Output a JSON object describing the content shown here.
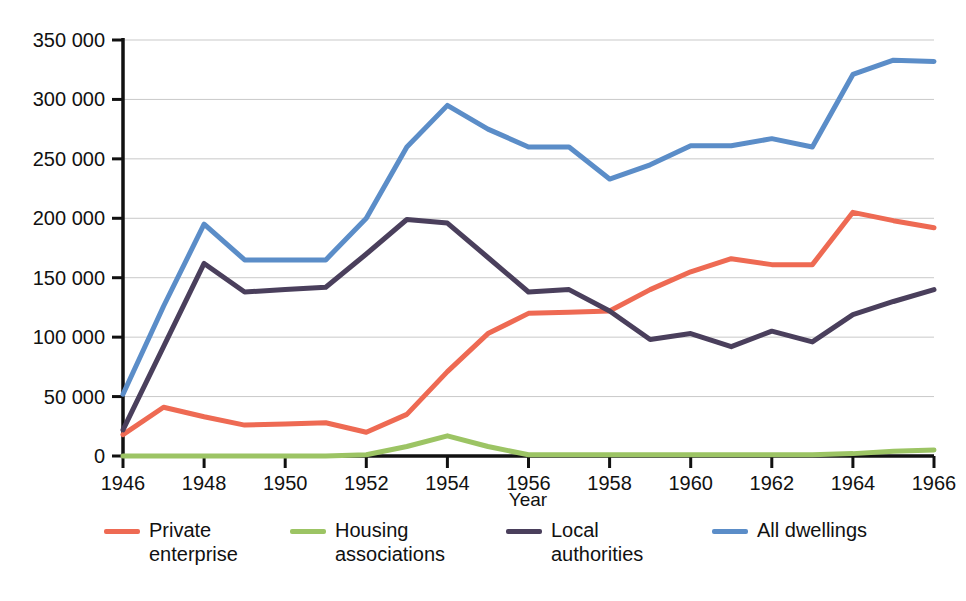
{
  "chart_data": {
    "type": "line",
    "title": "",
    "xlabel": "Year",
    "ylabel": "",
    "xlim": [
      1946,
      1966
    ],
    "ylim": [
      0,
      350000
    ],
    "grid": true,
    "legend_position": "bottom",
    "x": [
      1946,
      1947,
      1948,
      1949,
      1950,
      1951,
      1952,
      1953,
      1954,
      1955,
      1956,
      1957,
      1958,
      1959,
      1960,
      1961,
      1962,
      1963,
      1964,
      1965,
      1966
    ],
    "x_tick_labels": [
      "1946",
      "1948",
      "1950",
      "1952",
      "1954",
      "1956",
      "1958",
      "1960",
      "1962",
      "1964",
      "1966"
    ],
    "x_ticks": [
      1946,
      1948,
      1950,
      1952,
      1954,
      1956,
      1958,
      1960,
      1962,
      1964,
      1966
    ],
    "y_ticks": [
      0,
      50000,
      100000,
      150000,
      200000,
      250000,
      300000,
      350000
    ],
    "y_tick_labels": [
      "0",
      "50 000",
      "100 000",
      "150 000",
      "200 000",
      "250 000",
      "300 000",
      "350 000"
    ],
    "series": [
      {
        "name": "Private enterprise",
        "legend_label": "Private\nenterprise",
        "color": "#EE6A53",
        "values": [
          18000,
          41000,
          33000,
          26000,
          27000,
          28000,
          20000,
          35000,
          71000,
          103000,
          120000,
          121000,
          122000,
          140000,
          155000,
          166000,
          161000,
          161000,
          205000,
          198000,
          192000
        ]
      },
      {
        "name": "Housing associations",
        "legend_label": "Housing\nassociations",
        "color": "#9CC464",
        "values": [
          0,
          0,
          0,
          0,
          0,
          0,
          1000,
          8000,
          17000,
          8000,
          1000,
          1000,
          1000,
          1000,
          1000,
          1000,
          1000,
          1000,
          2000,
          4000,
          5000
        ]
      },
      {
        "name": "Local authorities",
        "legend_label": "Local\nauthorities",
        "color": "#4A3F5C",
        "values": [
          22000,
          92000,
          162000,
          138000,
          140000,
          142000,
          170000,
          199000,
          196000,
          167000,
          138000,
          140000,
          122000,
          98000,
          103000,
          92000,
          105000,
          96000,
          119000,
          130000,
          140000
        ]
      },
      {
        "name": "All dwellings",
        "legend_label": "All dwellings",
        "color": "#5B8DC8",
        "values": [
          52000,
          126000,
          195000,
          165000,
          165000,
          165000,
          200000,
          260000,
          295000,
          275000,
          260000,
          260000,
          233000,
          245000,
          261000,
          261000,
          267000,
          260000,
          321000,
          333000,
          332000
        ]
      }
    ]
  },
  "axes": {
    "x_axis_title": "Year"
  }
}
